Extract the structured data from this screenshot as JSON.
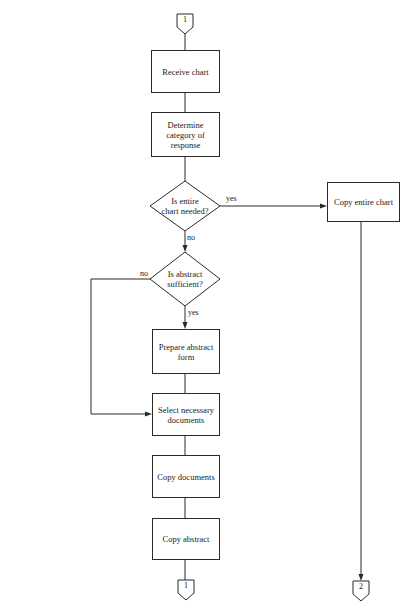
{
  "diagram": {
    "type": "flowchart",
    "connectors": {
      "top": {
        "label": "1"
      },
      "bottom_left": {
        "label": "1"
      },
      "bottom_right": {
        "label": "2"
      }
    },
    "processes": {
      "receive_chart": "Receive chart",
      "determine_category": "Determine category of response",
      "copy_entire_chart": "Copy entire chart",
      "prepare_abstract_form": "Prepare abstract form",
      "select_documents": "Select necessary documents",
      "copy_documents": "Copy documents",
      "copy_abstract": "Copy abstract"
    },
    "decisions": {
      "entire_chart_needed": {
        "line1": "Is entire",
        "line2": "chart needed?",
        "yes": "yes",
        "no": "no"
      },
      "abstract_sufficient": {
        "line1": "Is abstract",
        "line2": "sufficient?",
        "yes": "yes",
        "no": "no"
      }
    },
    "edges": [
      {
        "from": "connector 1",
        "to": "Receive chart"
      },
      {
        "from": "Receive chart",
        "to": "Determine category of response"
      },
      {
        "from": "Determine category of response",
        "to": "Is entire chart needed?"
      },
      {
        "from": "Is entire chart needed?",
        "to": "Copy entire chart",
        "label": "yes"
      },
      {
        "from": "Is entire chart needed?",
        "to": "Is abstract sufficient?",
        "label": "no"
      },
      {
        "from": "Is abstract sufficient?",
        "to": "Prepare abstract form",
        "label": "yes"
      },
      {
        "from": "Is abstract sufficient?",
        "to": "Select necessary documents",
        "label": "no"
      },
      {
        "from": "Prepare abstract form",
        "to": "Select necessary documents"
      },
      {
        "from": "Select necessary documents",
        "to": "Copy documents"
      },
      {
        "from": "Copy documents",
        "to": "Copy abstract"
      },
      {
        "from": "Copy abstract",
        "to": "connector 1"
      },
      {
        "from": "Copy entire chart",
        "to": "connector 2"
      }
    ]
  }
}
